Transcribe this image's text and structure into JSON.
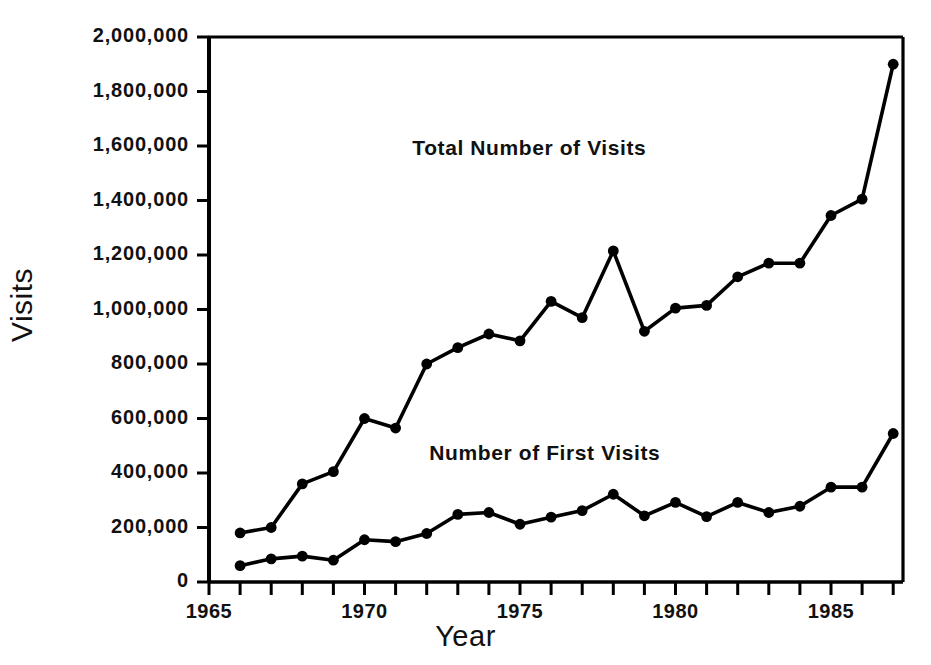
{
  "chart_data": {
    "type": "line",
    "title": "",
    "xlabel": "Year",
    "ylabel": "Visits",
    "xlim": [
      1965,
      1987.8
    ],
    "ylim": [
      0,
      2000000
    ],
    "grid": false,
    "legend_position": "inline-annotations",
    "x": [
      1966,
      1967,
      1968,
      1969,
      1970,
      1971,
      1972,
      1973,
      1974,
      1975,
      1976,
      1977,
      1978,
      1979,
      1980,
      1981,
      1982,
      1983,
      1984,
      1985,
      1986,
      1987
    ],
    "series": [
      {
        "name": "Total Number of Visits",
        "values": [
          180000,
          200000,
          360000,
          405000,
          600000,
          565000,
          800000,
          860000,
          910000,
          885000,
          1030000,
          970000,
          1215000,
          920000,
          1005000,
          1015000,
          1120000,
          1170000,
          1170000,
          1345000,
          1405000,
          1900000
        ]
      },
      {
        "name": "Number of First Visits",
        "values": [
          60000,
          85000,
          95000,
          80000,
          155000,
          148000,
          178000,
          248000,
          255000,
          212000,
          238000,
          262000,
          322000,
          243000,
          292000,
          240000,
          292000,
          255000,
          278000,
          348000,
          348000,
          545000
        ]
      }
    ],
    "ytick_values": [
      0,
      200000,
      400000,
      600000,
      800000,
      1000000,
      1200000,
      1400000,
      1600000,
      1800000,
      2000000
    ],
    "ytick_labels": [
      "0",
      "200,000",
      "400,000",
      "600,000",
      "800,000",
      "1,000,000",
      "1,200,000",
      "1,400,000",
      "1,600,000",
      "1,800,000",
      "2,000,000"
    ],
    "xtick_values": [
      1965,
      1966,
      1967,
      1968,
      1969,
      1970,
      1971,
      1972,
      1973,
      1974,
      1975,
      1976,
      1977,
      1978,
      1979,
      1980,
      1981,
      1982,
      1983,
      1984,
      1985,
      1986,
      1987
    ],
    "xtick_major_values": [
      1965,
      1970,
      1975,
      1980,
      1985
    ],
    "xtick_major_labels": [
      "1965",
      "1970",
      "1975",
      "1980",
      "1985"
    ],
    "annotations": [
      {
        "text": "Total Number of Visits",
        "x": 1975.3,
        "y": 1590000
      },
      {
        "text": "Number of First Visits",
        "x": 1975.8,
        "y": 470000
      }
    ],
    "colors": {
      "line": "#000000",
      "marker": "#000000",
      "axis": "#000000",
      "background": "#ffffff"
    }
  },
  "axes": {
    "ylabel": "Visits",
    "xlabel": "Year"
  }
}
